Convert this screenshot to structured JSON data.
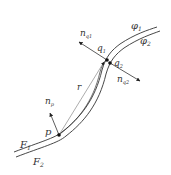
{
  "diagram": {
    "labels": {
      "phi1": "φ",
      "phi1_sub": "1",
      "phi2": "φ",
      "phi2_sub": "2",
      "F1": "F",
      "F1_sub": "1",
      "F2": "F",
      "F2_sub": "2",
      "p": "p",
      "q1": "q",
      "q1_sub": "1",
      "q2": "q",
      "q2_sub": "2",
      "r": "r",
      "np": "n",
      "np_sub": "p",
      "nq1": "n",
      "nq1_sub": "q1",
      "nq2": "n",
      "nq2_sub": "q2"
    },
    "colors": {
      "line": "#333333",
      "thin_line": "#777777",
      "text": "#333333"
    }
  }
}
